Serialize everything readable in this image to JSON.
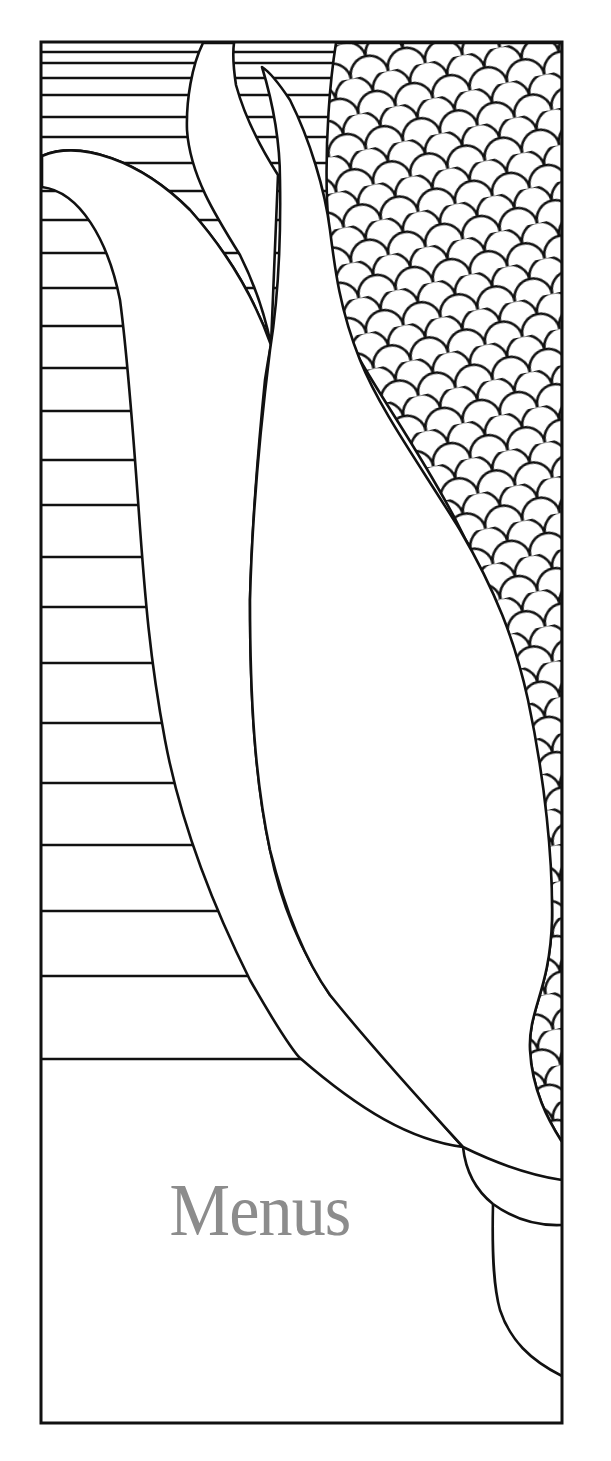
{
  "cover": {
    "title": "Menus",
    "title_color": "#8c8c8c",
    "line_color": "#111111",
    "background": "#ffffff"
  },
  "illustration": {
    "subject": "stylized ear of corn with husk leaves",
    "icons": [
      "corn-cob-icon",
      "husk-leaf-icon",
      "outer-leaf-icon",
      "back-leaf-icon",
      "stripe-pattern",
      "kernel-pattern",
      "frame-border"
    ]
  }
}
